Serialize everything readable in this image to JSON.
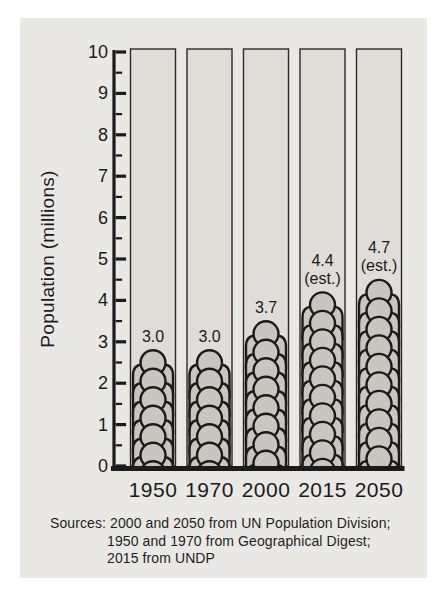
{
  "figure": {
    "sources_line1": "Sources: 2000 and 2050 from UN Population Division;",
    "sources_line2": "1950 and 1970 from Geographical Digest;",
    "sources_line3": "2015 from UNDP"
  },
  "chart_data": {
    "type": "bar",
    "style": "pictograph-stacked-person-icons",
    "title": "",
    "xlabel": "",
    "ylabel": "Population (millions)",
    "categories": [
      "1950",
      "1970",
      "2000",
      "2015",
      "2050"
    ],
    "values": [
      3.0,
      3.0,
      3.7,
      4.4,
      4.7
    ],
    "value_labels": [
      "3.0",
      "3.0",
      "3.7",
      "4.4",
      "4.7"
    ],
    "estimated": [
      false,
      false,
      false,
      true,
      true
    ],
    "estimate_note": "(est.)",
    "ylim": [
      0,
      10
    ],
    "y_major_ticks": [
      "0",
      "1",
      "2",
      "3",
      "4",
      "5",
      "6",
      "7",
      "8",
      "9",
      "10"
    ],
    "y_minor_step": 0.5,
    "grid": false,
    "legend": null,
    "colors": {
      "page_bg": "#ffffff",
      "panel_bg": "#eae8e4",
      "bar_fill": "#e0ddd8",
      "icon_fill": "#c9c6c0",
      "ink": "#1b1b1b"
    }
  }
}
